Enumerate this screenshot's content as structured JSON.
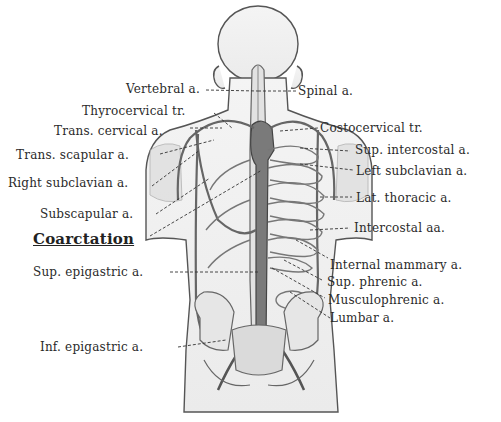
{
  "figure": {
    "highlight_label": "Coarctation",
    "labels_left": [
      {
        "id": "vertebral",
        "text": "Vertebral a."
      },
      {
        "id": "thyrocervical",
        "text": "Thyrocervical tr."
      },
      {
        "id": "trans-cervical",
        "text": "Trans. cervical a."
      },
      {
        "id": "trans-scapular",
        "text": "Trans. scapular a."
      },
      {
        "id": "right-subclavian",
        "text": "Right subclavian a."
      },
      {
        "id": "subscapular",
        "text": "Subscapular a."
      },
      {
        "id": "coarctation",
        "text": "Coarctation"
      },
      {
        "id": "sup-epigastric",
        "text": "Sup. epigastric a."
      },
      {
        "id": "inf-epigastric",
        "text": "Inf. epigastric a."
      }
    ],
    "labels_right": [
      {
        "id": "spinal",
        "text": "Spinal a."
      },
      {
        "id": "costocervical",
        "text": "Costocervical tr."
      },
      {
        "id": "sup-intercostal",
        "text": "Sup. intercostal a."
      },
      {
        "id": "left-subclavian",
        "text": "Left subclavian a."
      },
      {
        "id": "lat-thoracic",
        "text": "Lat. thoracic a."
      },
      {
        "id": "intercostal",
        "text": "Intercostal aa."
      },
      {
        "id": "internal-mammary",
        "text": "Internal mammary a."
      },
      {
        "id": "sup-phrenic",
        "text": "Sup. phrenic a."
      },
      {
        "id": "musculophrenic",
        "text": "Musculophrenic a."
      },
      {
        "id": "lumbar",
        "text": "Lumbar a."
      }
    ]
  }
}
